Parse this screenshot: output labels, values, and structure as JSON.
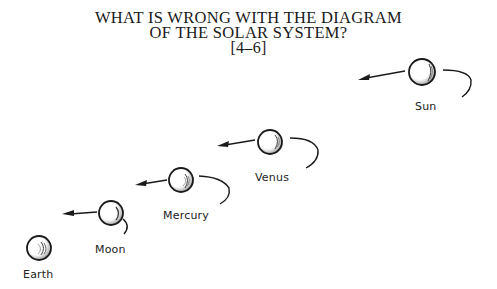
{
  "title": {
    "line1": "WHAT IS WRONG WITH THE DIAGRAM",
    "line2": "OF THE SOLAR SYSTEM?",
    "grade_range": "[4–6]"
  },
  "bodies": [
    {
      "name": "Sun",
      "label": "Sun"
    },
    {
      "name": "Venus",
      "label": "Venus"
    },
    {
      "name": "Mercury",
      "label": "Mercury"
    },
    {
      "name": "Moon",
      "label": "Moon"
    },
    {
      "name": "Earth",
      "label": "Earth"
    }
  ],
  "colors": {
    "ink": "#1a1a1a",
    "background": "#ffffff"
  }
}
